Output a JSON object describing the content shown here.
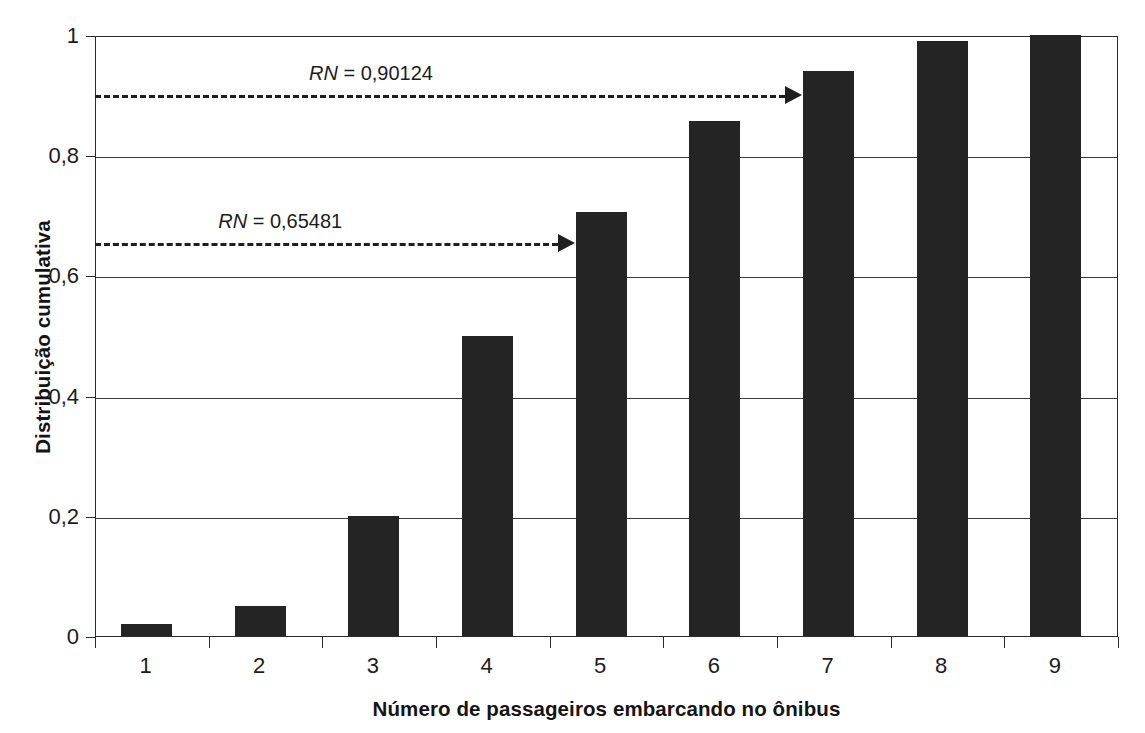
{
  "chart_data": {
    "type": "bar",
    "title": "",
    "subtitle": "",
    "xlabel": "Número de passageiros embarcando no ônibus",
    "ylabel": "Distribuição cumulativa",
    "categories": [
      "1",
      "2",
      "3",
      "4",
      "5",
      "6",
      "7",
      "8",
      "9"
    ],
    "values": [
      0.02,
      0.05,
      0.2,
      0.5,
      0.705,
      0.857,
      0.94,
      0.99,
      1.0
    ],
    "ylim": [
      0,
      1
    ],
    "yticks": [
      0,
      0.2,
      0.4,
      0.6,
      0.8,
      1
    ],
    "ytick_labels": [
      "0",
      "0,2",
      "0,4",
      "0,6",
      "0,8",
      "1"
    ],
    "grid": true,
    "grid_axis": "y",
    "legend": "none",
    "bar_color": "#242424",
    "annotations": [
      {
        "label_prefix": "RN",
        "label_equals": " = ",
        "label_value": "0,90124",
        "text": "RN = 0,90124",
        "y": 0.90124,
        "arrow_to_category": "7",
        "style": "dashed-arrow"
      },
      {
        "label_prefix": "RN",
        "label_equals": " = ",
        "label_value": "0,65481",
        "text": "RN = 0,65481",
        "y": 0.65481,
        "arrow_to_category": "5",
        "style": "dashed-arrow"
      }
    ]
  }
}
